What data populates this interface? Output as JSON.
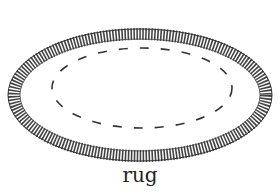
{
  "illustration": {
    "subject": "oval rug with fringed border",
    "caption": "rug",
    "stroke_color": "#1a1a1a"
  }
}
